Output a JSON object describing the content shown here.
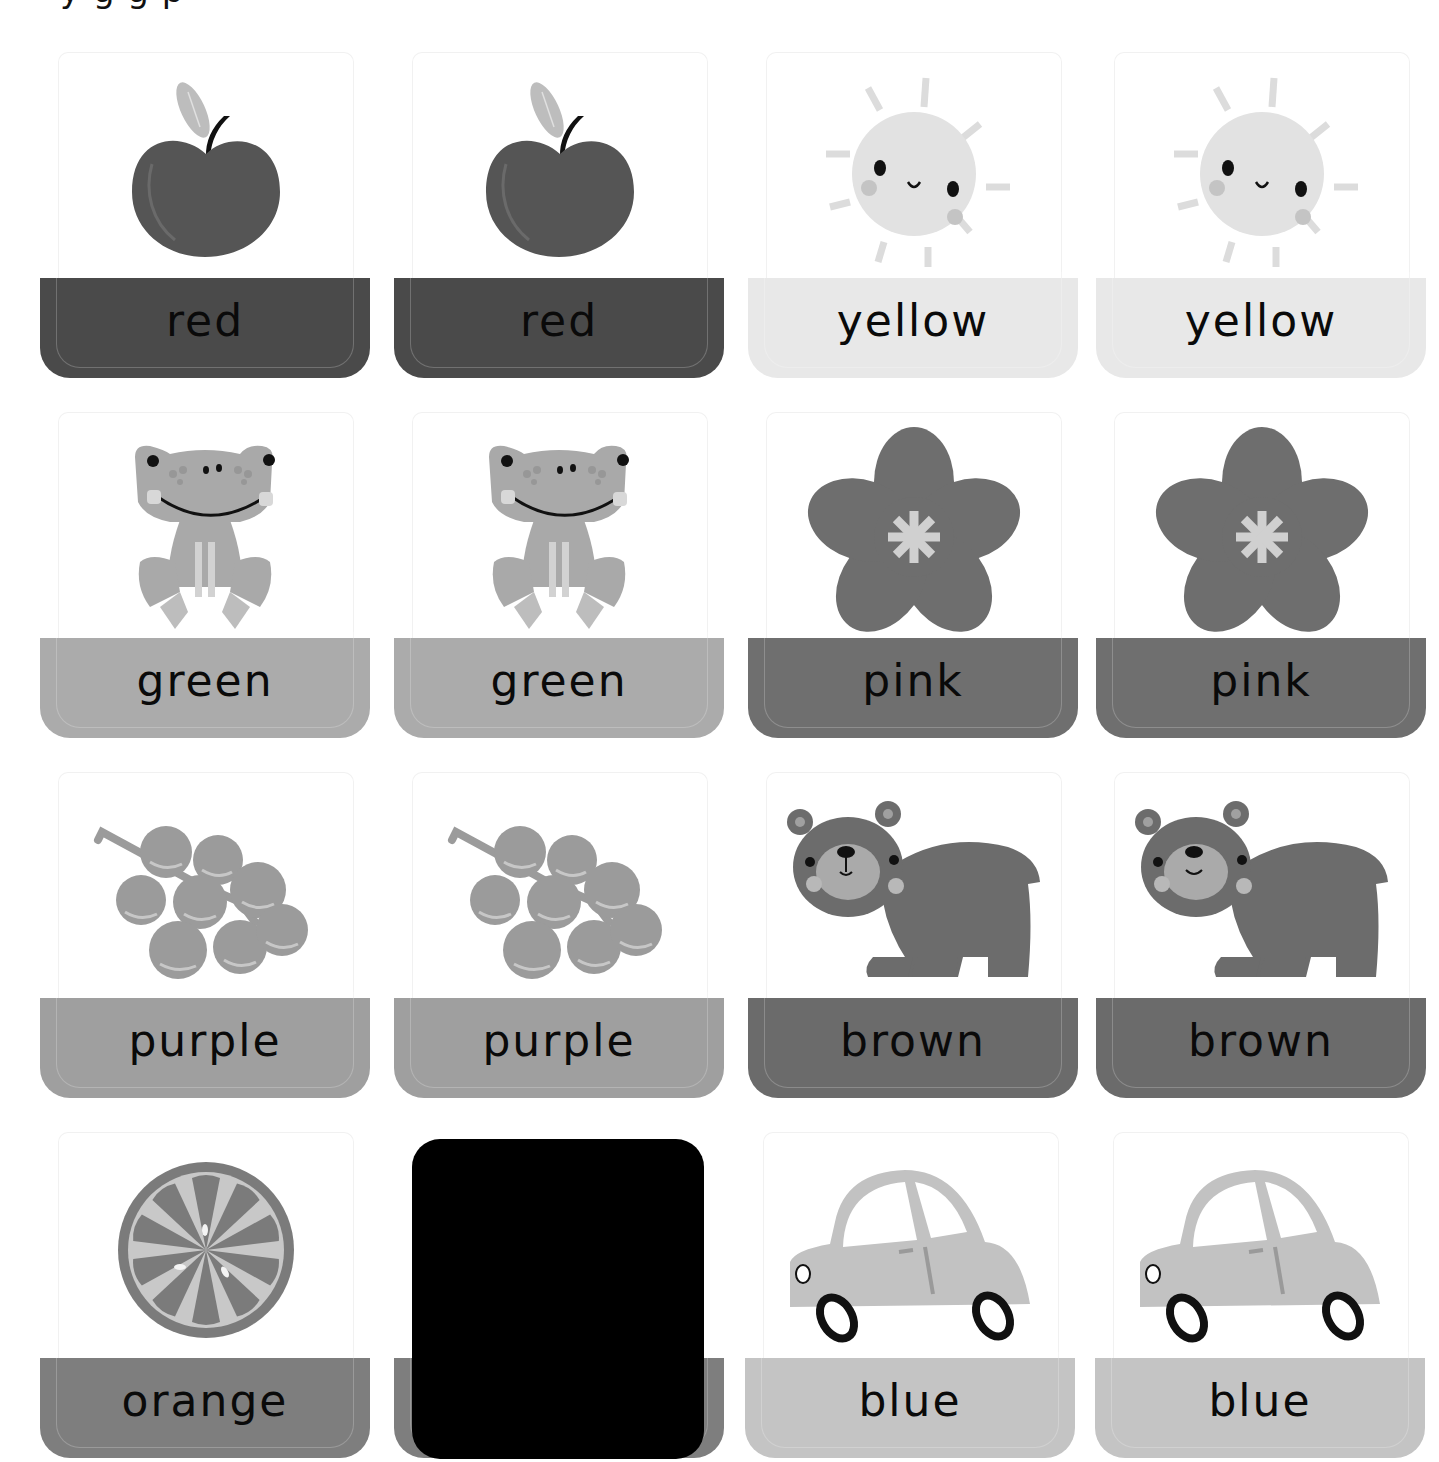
{
  "page": {
    "clipped_header_text": "y  g  g       p        "
  },
  "palette": {
    "red": "#4a4a4a",
    "yellow": "#e8e8e8",
    "green": "#ababab",
    "pink": "#6f6f6f",
    "purple": "#9f9f9f",
    "brown": "#6b6b6b",
    "orange": "#7e7e7e",
    "blue": "#c4c4c4",
    "art_red": "#555555",
    "art_yellow": "#e2e2e2",
    "art_green": "#a9a9a9",
    "art_pink": "#6e6e6e",
    "art_purple": "#9b9b9b",
    "art_brown": "#6c6c6c",
    "art_orange": "#7b7b7b",
    "art_blue": "#c2c2c2"
  },
  "cards": [
    {
      "id": "red-1",
      "label": "red",
      "icon": "apple-icon",
      "color": "red"
    },
    {
      "id": "red-2",
      "label": "red",
      "icon": "apple-icon",
      "color": "red"
    },
    {
      "id": "yellow-1",
      "label": "yellow",
      "icon": "sun-icon",
      "color": "yellow"
    },
    {
      "id": "yellow-2",
      "label": "yellow",
      "icon": "sun-icon",
      "color": "yellow"
    },
    {
      "id": "green-1",
      "label": "green",
      "icon": "frog-icon",
      "color": "green"
    },
    {
      "id": "green-2",
      "label": "green",
      "icon": "frog-icon",
      "color": "green"
    },
    {
      "id": "pink-1",
      "label": "pink",
      "icon": "flower-icon",
      "color": "pink"
    },
    {
      "id": "pink-2",
      "label": "pink",
      "icon": "flower-icon",
      "color": "pink"
    },
    {
      "id": "purple-1",
      "label": "purple",
      "icon": "grapes-icon",
      "color": "purple"
    },
    {
      "id": "purple-2",
      "label": "purple",
      "icon": "grapes-icon",
      "color": "purple"
    },
    {
      "id": "brown-1",
      "label": "brown",
      "icon": "bear-icon",
      "color": "brown"
    },
    {
      "id": "brown-2",
      "label": "brown",
      "icon": "bear-icon",
      "color": "brown"
    },
    {
      "id": "orange-1",
      "label": "orange",
      "icon": "orange-slice-icon",
      "color": "orange"
    },
    {
      "id": "orange-2",
      "label": "",
      "icon": "redacted",
      "color": "orange"
    },
    {
      "id": "blue-1",
      "label": "blue",
      "icon": "car-icon",
      "color": "blue"
    },
    {
      "id": "blue-2",
      "label": "blue",
      "icon": "car-icon",
      "color": "blue"
    }
  ]
}
